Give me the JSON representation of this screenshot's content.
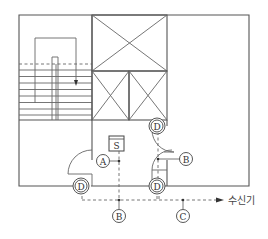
{
  "diagram": {
    "labels": {
      "smoke_detector": "S",
      "door_release_1": "D",
      "door_release_2": "D",
      "door_release_3": "D",
      "wire_a": "A",
      "wire_b_right": "B",
      "wire_b_bottom": "B",
      "wire_c": "C",
      "receiver": "수신기"
    },
    "legend": {
      "S": "smoke detector",
      "D": "door release device",
      "A": "wiring A",
      "B": "wiring B",
      "C": "wiring C",
      "수신기": "receiver (control panel)"
    },
    "colors": {
      "line": "#555555",
      "text": "#333333",
      "background": "#ffffff"
    }
  }
}
